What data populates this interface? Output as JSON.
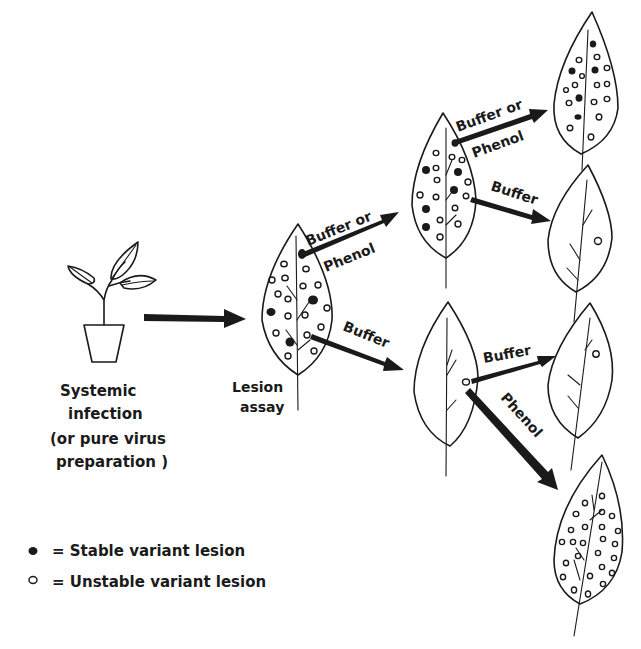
{
  "diagram": {
    "source": {
      "title_line1": "Systemic",
      "title_line2": "infection",
      "note_line1": "(or pure virus",
      "note_line2": "preparation )"
    },
    "lesion_assay": {
      "line1": "Lesion",
      "line2": "assay"
    },
    "arrows": {
      "a1_line1": "Buffer or",
      "a1_line2": "Phenol",
      "a2": "Buffer",
      "a3_line1": "Buffer or",
      "a3_line2": "Phenol",
      "a4": "Buffer",
      "a5": "Buffer",
      "a6": "Phenol"
    },
    "legend": {
      "stable": "= Stable variant lesion",
      "unstable": "= Unstable variant lesion"
    },
    "colors": {
      "ink": "#1a1a1a",
      "background": "#ffffff"
    }
  }
}
